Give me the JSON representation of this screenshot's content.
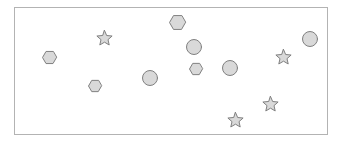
{
  "canvas": {
    "width": 343,
    "height": 142,
    "background_color": "#ffffff"
  },
  "frame": {
    "name": "shape-panel-frame",
    "x": 14,
    "y": 7,
    "width": 314,
    "height": 128,
    "fill_color": "#ffffff",
    "border_color": "#b3b3b3",
    "border_width": 1
  },
  "style": {
    "shape_fill_color": "#d9d9d9",
    "shape_stroke_color": "#808080",
    "shape_stroke_width": 1
  },
  "legend": {
    "hexagon_count": 5,
    "circle_count": 4,
    "star_count": 4,
    "total_count": 13
  },
  "shapes": [
    {
      "id": "hexagon-1",
      "type": "hexagon",
      "cx": 49,
      "cy": 57,
      "size": 15
    },
    {
      "id": "hexagon-2",
      "type": "hexagon",
      "cx": 95,
      "cy": 86,
      "size": 14
    },
    {
      "id": "hexagon-3",
      "type": "hexagon",
      "cx": 177,
      "cy": 22,
      "size": 17
    },
    {
      "id": "hexagon-4",
      "type": "hexagon",
      "cx": 196,
      "cy": 69,
      "size": 14
    },
    {
      "id": "hexagon-5",
      "type": "hexagon",
      "cx": 196,
      "cy": 69,
      "size": 0
    },
    {
      "id": "circle-1",
      "type": "circle",
      "cx": 150,
      "cy": 78,
      "size": 16
    },
    {
      "id": "circle-2",
      "type": "circle",
      "cx": 194,
      "cy": 47,
      "size": 16
    },
    {
      "id": "circle-3",
      "type": "circle",
      "cx": 230,
      "cy": 68,
      "size": 16
    },
    {
      "id": "circle-4",
      "type": "circle",
      "cx": 310,
      "cy": 39,
      "size": 16
    },
    {
      "id": "star-1",
      "type": "star",
      "cx": 104,
      "cy": 38,
      "size": 17
    },
    {
      "id": "star-2",
      "type": "star",
      "cx": 283,
      "cy": 57,
      "size": 17
    },
    {
      "id": "star-3",
      "type": "star",
      "cx": 270,
      "cy": 104,
      "size": 17
    },
    {
      "id": "star-4",
      "type": "star",
      "cx": 235,
      "cy": 120,
      "size": 17
    }
  ]
}
